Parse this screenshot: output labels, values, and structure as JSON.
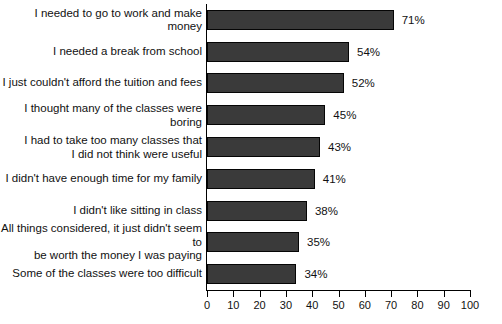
{
  "chart_data": {
    "type": "bar",
    "orientation": "horizontal",
    "title": "",
    "subtitle": "",
    "xlabel": "",
    "ylabel": "",
    "xlim": [
      0,
      100
    ],
    "xticks": [
      0,
      10,
      20,
      30,
      40,
      50,
      60,
      70,
      80,
      90,
      100
    ],
    "xtick_labels": [
      "0",
      "10",
      "20",
      "30",
      "40",
      "50",
      "60",
      "70",
      "80",
      "90",
      "100"
    ],
    "grid": false,
    "legend": false,
    "value_suffix": "%",
    "bar_color": "#3a3a3a",
    "bar_edge_color": "#050505",
    "axis_color": "#000000",
    "background_color": "#ffffff",
    "categories": [
      "I needed to go to work and make money",
      "I needed a break from school",
      "I just couldn't afford the tuition and fees",
      "I thought many of the classes were boring",
      "I had to take too many classes that\nI did not think were useful",
      "I didn't have enough time for my family",
      "I didn't like sitting in class",
      "All things considered, it just didn't seem to\nbe worth the money I was paying",
      "Some of the classes were too difficult"
    ],
    "values": [
      71,
      54,
      52,
      45,
      43,
      41,
      38,
      35,
      34
    ],
    "value_labels": [
      "71%",
      "54%",
      "52%",
      "45%",
      "43%",
      "41%",
      "38%",
      "35%",
      "34%"
    ]
  }
}
